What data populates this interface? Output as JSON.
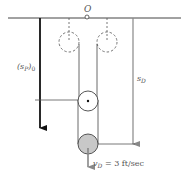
{
  "diagram": {
    "type": "pulley-system",
    "origin_label": "O",
    "labels": {
      "sp0": {
        "main": "(s",
        "sub": "P",
        "close": ")",
        "subscript0": "0"
      },
      "sd": {
        "main": "s",
        "sub": "D"
      },
      "vd": {
        "main": "v",
        "sub": "D",
        "rest": " = 3 ft/sec"
      }
    },
    "colors": {
      "line": "#333333",
      "thick_arrow": "#111111",
      "gray_arrow": "#888888",
      "gray_pulley_fill": "#c8c8c8",
      "dashed": "#555555"
    }
  }
}
